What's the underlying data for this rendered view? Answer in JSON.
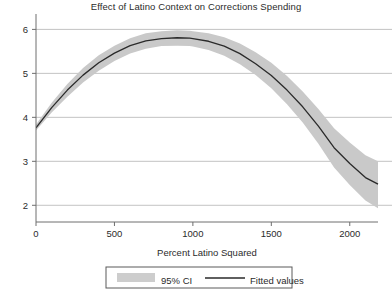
{
  "chart_data": {
    "type": "line",
    "title": "Effect of Latino Context on Corrections Spending",
    "xlabel": "Percent Latino Squared",
    "ylabel": "",
    "xlim": [
      0,
      2180
    ],
    "ylim": [
      1.62,
      6.35
    ],
    "xticks": [
      0,
      500,
      1000,
      1500,
      2000
    ],
    "xtick_labels": [
      "0",
      "500",
      "1000",
      "1500",
      "2000"
    ],
    "yticks": [
      2,
      3,
      4,
      5,
      6
    ],
    "ytick_labels": [
      "2",
      "3",
      "4",
      "5",
      "6"
    ],
    "grid": "horizontal",
    "legend_position": "bottom-center",
    "series": [
      {
        "name": "Fitted values",
        "type": "line",
        "color": "#2a2a2a",
        "x": [
          0,
          100,
          200,
          300,
          400,
          500,
          600,
          700,
          800,
          900,
          980,
          1000,
          1100,
          1200,
          1300,
          1400,
          1500,
          1600,
          1700,
          1800,
          1900,
          2000,
          2100,
          2180
        ],
        "values": [
          3.76,
          4.22,
          4.62,
          4.96,
          5.24,
          5.46,
          5.63,
          5.74,
          5.79,
          5.81,
          5.8,
          5.79,
          5.73,
          5.62,
          5.45,
          5.22,
          4.95,
          4.62,
          4.24,
          3.8,
          3.31,
          2.95,
          2.63,
          2.48
        ]
      },
      {
        "name": "95% CI",
        "type": "band",
        "color": "#c9c9c9",
        "x": [
          0,
          100,
          200,
          300,
          400,
          500,
          600,
          700,
          800,
          900,
          980,
          1000,
          1100,
          1200,
          1300,
          1400,
          1500,
          1600,
          1700,
          1800,
          1900,
          2000,
          2100,
          2180
        ],
        "lower": [
          3.7,
          4.11,
          4.47,
          4.79,
          5.06,
          5.28,
          5.45,
          5.56,
          5.62,
          5.63,
          5.62,
          5.61,
          5.53,
          5.4,
          5.21,
          4.96,
          4.66,
          4.3,
          3.88,
          3.4,
          2.86,
          2.46,
          2.11,
          1.93
        ],
        "upper": [
          3.84,
          4.33,
          4.76,
          5.12,
          5.41,
          5.63,
          5.8,
          5.91,
          5.96,
          5.98,
          5.97,
          5.96,
          5.91,
          5.82,
          5.68,
          5.48,
          5.24,
          4.94,
          4.59,
          4.19,
          3.75,
          3.43,
          3.14,
          3.0
        ]
      }
    ]
  },
  "legend": {
    "ci_label": "95% CI",
    "fitted_label": "Fitted values"
  },
  "colors": {
    "line": "#2a2a2a",
    "band": "#c9c9c9",
    "grid": "#b4b4b4",
    "axis": "#6e6e6e",
    "text": "#2b2b2b"
  }
}
